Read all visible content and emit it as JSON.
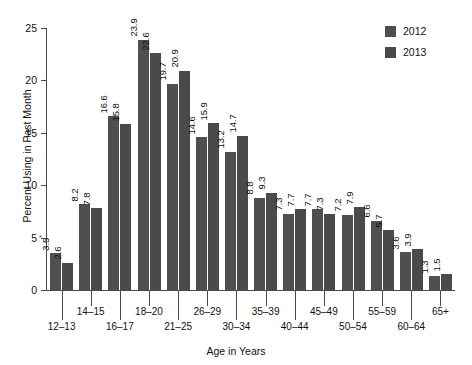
{
  "chart_data": {
    "type": "bar",
    "title": "",
    "xlabel": "Age in Years",
    "ylabel": "Percent Using in Past Month",
    "ylim": [
      0,
      25
    ],
    "yticks": [
      0,
      5,
      10,
      15,
      20,
      25
    ],
    "grid": false,
    "legend_position": "top-right",
    "categories": [
      "12–13",
      "14–15",
      "16–17",
      "18–20",
      "21–25",
      "26–29",
      "30–34",
      "35–39",
      "40–44",
      "45–49",
      "50–54",
      "55–59",
      "60–64",
      "65+"
    ],
    "series": [
      {
        "name": "2012",
        "color": "#4f4f4f",
        "values": [
          3.5,
          8.2,
          16.6,
          23.9,
          19.7,
          14.6,
          13.2,
          8.8,
          7.3,
          7.7,
          7.2,
          6.6,
          3.6,
          1.3
        ],
        "labels": [
          "3.5",
          "8.2",
          "16.6",
          "23.9",
          "19.7",
          "14.6",
          "13.2",
          "8.8",
          "7.3",
          "7.7",
          "7.2",
          "6.6",
          "3.6",
          "1.3"
        ],
        "label_markers": [
          "*",
          "",
          "",
          "",
          "",
          "",
          "",
          "",
          "",
          "",
          "",
          "",
          "",
          ""
        ]
      },
      {
        "name": "2013",
        "color": "#4a4a4a",
        "values": [
          2.6,
          7.8,
          15.8,
          22.6,
          20.9,
          15.9,
          14.7,
          9.3,
          7.7,
          7.3,
          7.9,
          5.7,
          3.9,
          1.5
        ],
        "labels": [
          "2.6",
          "7.8",
          "15.8",
          "22.6",
          "20.9",
          "15.9",
          "14.7",
          "9.3",
          "7.7",
          "7.3",
          "7.9",
          "5.7",
          "3.9",
          "1.5"
        ],
        "label_markers": [
          "",
          "",
          "",
          "",
          "",
          "",
          "",
          "",
          "",
          "",
          "",
          "",
          "",
          ""
        ]
      }
    ]
  },
  "legend": {
    "items": [
      {
        "label": "2012"
      },
      {
        "label": "2013"
      }
    ]
  }
}
